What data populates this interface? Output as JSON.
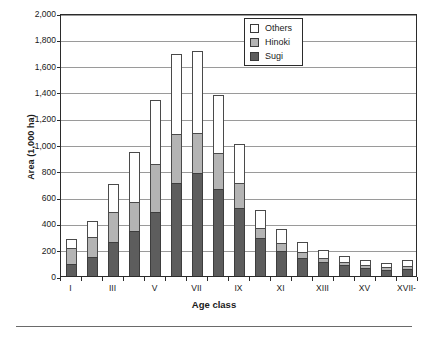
{
  "chart": {
    "ylabel": "Area (1,000 ha)",
    "xlabel": "Age class"
  },
  "legend": {
    "position": "top-right",
    "items": [
      {
        "label": "Others",
        "color": "#ffffff",
        "swatch_name": "legend-swatch-others"
      },
      {
        "label": "Hinoki",
        "color": "#b4b4b4",
        "swatch_name": "legend-swatch-hinoki"
      },
      {
        "label": "Sugi",
        "color": "#5d5d5d",
        "swatch_name": "legend-swatch-sugi"
      }
    ]
  },
  "chart_data": {
    "type": "bar",
    "stacked": true,
    "title": "",
    "xlabel": "Age class",
    "ylabel": "Area (1,000 ha)",
    "ylim": [
      0,
      2000
    ],
    "yticks": [
      "0",
      "200",
      "400",
      "600",
      "800",
      "1,000",
      "1,200",
      "1,400",
      "1,600",
      "1,800",
      "2,000"
    ],
    "ytick_values": [
      0,
      200,
      400,
      600,
      800,
      1000,
      1200,
      1400,
      1600,
      1800,
      2000
    ],
    "grid": "horizontal",
    "legend_position": "top right",
    "categories": [
      "I",
      "II",
      "III",
      "IV",
      "V",
      "VI",
      "VII",
      "VIII",
      "IX",
      "X",
      "XI",
      "XII",
      "XIII",
      "XIV",
      "XV",
      "XVI",
      "XVII-"
    ],
    "tick_labels": [
      "I",
      "III",
      "V",
      "VII",
      "IX",
      "XI",
      "XIII",
      "XV",
      "XVII-"
    ],
    "series": [
      {
        "name": "Sugi",
        "color": "#5d5d5d",
        "values": [
          90,
          145,
          255,
          340,
          490,
          710,
          780,
          660,
          520,
          290,
          190,
          140,
          105,
          80,
          60,
          45,
          55
        ]
      },
      {
        "name": "Hinoki",
        "color": "#b4b4b4",
        "values": [
          120,
          155,
          235,
          220,
          360,
          370,
          310,
          275,
          185,
          75,
          60,
          45,
          35,
          30,
          25,
          20,
          25
        ]
      },
      {
        "name": "Others",
        "color": "#ffffff",
        "values": [
          70,
          120,
          210,
          380,
          490,
          610,
          620,
          445,
          300,
          140,
          105,
          75,
          60,
          45,
          40,
          35,
          45
        ]
      }
    ],
    "totals": [
      280,
      420,
      700,
      940,
      1340,
      1690,
      1710,
      1380,
      1005,
      505,
      355,
      260,
      200,
      155,
      125,
      100,
      125
    ]
  }
}
